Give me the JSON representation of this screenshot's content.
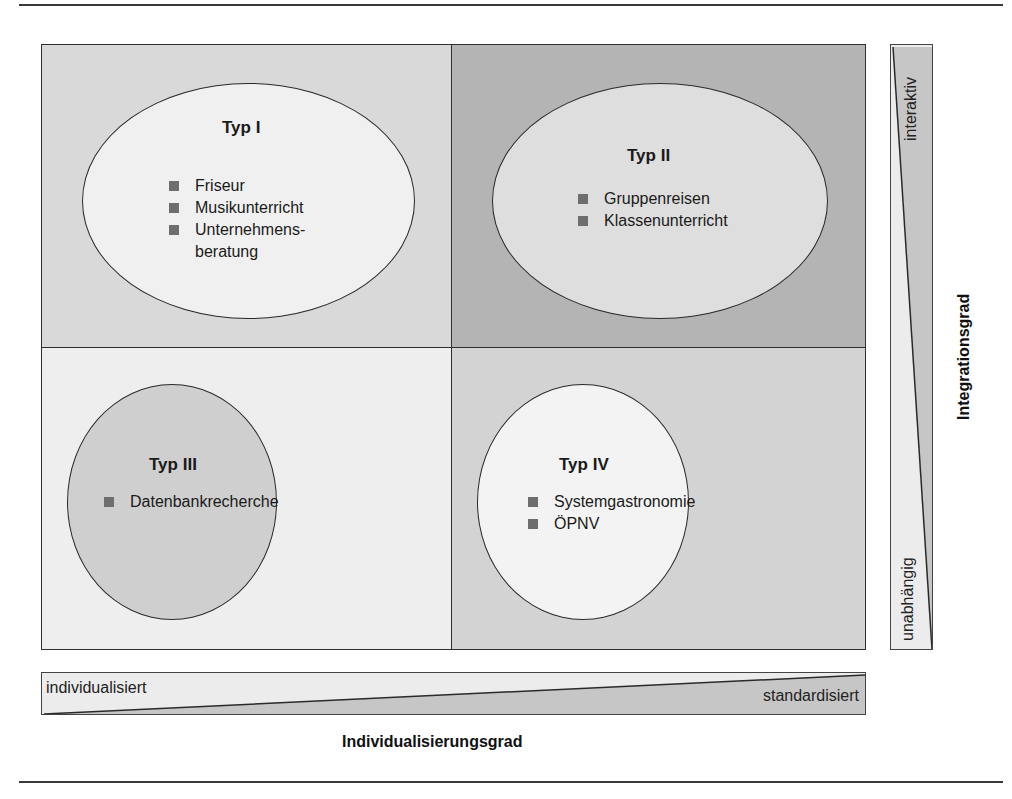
{
  "diagram": {
    "quadrants": [
      {
        "id": "q1",
        "title": "Typ I",
        "items": [
          "Friseur",
          "Musikunterricht",
          "Unternehmens-\nberatung"
        ],
        "item_lines": [
          [
            "Friseur"
          ],
          [
            "Musikunterricht"
          ],
          [
            "Unternehmens-",
            "beratung"
          ]
        ],
        "background": "#d9d9d9",
        "ellipse_fill": "#f0f0f0"
      },
      {
        "id": "q2",
        "title": "Typ II",
        "items": [
          "Gruppenreisen",
          "Klassenunterricht"
        ],
        "background": "#b4b4b4",
        "ellipse_fill": "#dedede"
      },
      {
        "id": "q3",
        "title": "Typ III",
        "items": [
          "Datenbankrecherche"
        ],
        "background": "#eeeeee",
        "ellipse_fill": "#cfcfcf"
      },
      {
        "id": "q4",
        "title": "Typ IV",
        "items": [
          "Systemgastronomie",
          "ÖPNV"
        ],
        "background": "#d3d3d3",
        "ellipse_fill": "#f3f3f3"
      }
    ],
    "vertical_axis": {
      "title": "Integrationsgrad",
      "top_label": "interaktiv",
      "bottom_label": "unabhängig"
    },
    "horizontal_axis": {
      "title": "Individualisierungsgrad",
      "left_label": "individualisiert",
      "right_label": "standardisiert"
    },
    "colors": {
      "border": "#2f2f2f",
      "bullet": "#6e6e6e",
      "wedge_light": "#ececec",
      "wedge_dark": "#c6c6c6"
    }
  }
}
